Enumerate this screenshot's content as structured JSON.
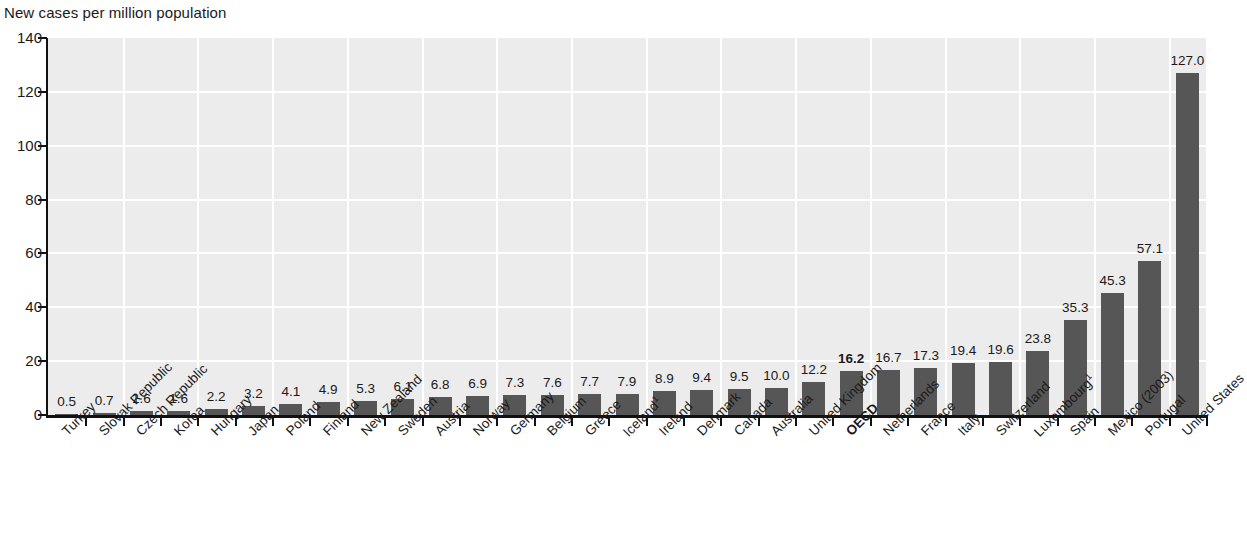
{
  "chart_data": {
    "type": "bar",
    "title": "",
    "ylabel": "New cases per million population",
    "xlabel": "",
    "ylim": [
      0,
      140
    ],
    "yticks": [
      0,
      20,
      40,
      60,
      80,
      100,
      120,
      140
    ],
    "grid": true,
    "legend": "none",
    "orientation": "vertical",
    "bar_color": "#565656",
    "plot_background": "#ececec",
    "gridline_color": "#ffffff",
    "axis_color": "#111111",
    "highlight_category": "OECD",
    "categories": [
      "Turkey",
      "Slovak Republic",
      "Czech Republic",
      "Korea",
      "Hungary",
      "Japan",
      "Poland",
      "Finland",
      "New Zealand",
      "Sweden",
      "Austria",
      "Norway",
      "Germany",
      "Belgium",
      "Greece",
      "Iceland¹",
      "Ireland",
      "Denmark",
      "Canada",
      "Australia",
      "United Kingdom",
      "OECD",
      "Netherlands",
      "France",
      "Italy",
      "Switzerland",
      "Luxembourg¹",
      "Spain",
      "Mexico (2003)",
      "Portugal",
      "United States"
    ],
    "values": [
      0.5,
      0.7,
      1.6,
      1.6,
      2.2,
      3.2,
      4.1,
      4.9,
      5.3,
      6.1,
      6.8,
      6.9,
      7.3,
      7.6,
      7.7,
      7.9,
      8.9,
      9.4,
      9.5,
      10.0,
      12.2,
      16.2,
      16.7,
      17.3,
      19.4,
      19.6,
      23.8,
      35.3,
      45.3,
      57.1,
      127.0
    ],
    "value_labels": [
      "0.5",
      "0.7",
      "1.6",
      "1.6",
      "2.2",
      "3.2",
      "4.1",
      "4.9",
      "5.3",
      "6.1",
      "6.8",
      "6.9",
      "7.3",
      "7.6",
      "7.7",
      "7.9",
      "8.9",
      "9.4",
      "9.5",
      "10.0",
      "12.2",
      "16.2",
      "16.7",
      "17.3",
      "19.4",
      "19.6",
      "23.8",
      "35.3",
      "45.3",
      "57.1",
      "127.0"
    ],
    "footnote_markers": {
      "Iceland¹": "1",
      "Luxembourg¹": "1"
    }
  }
}
